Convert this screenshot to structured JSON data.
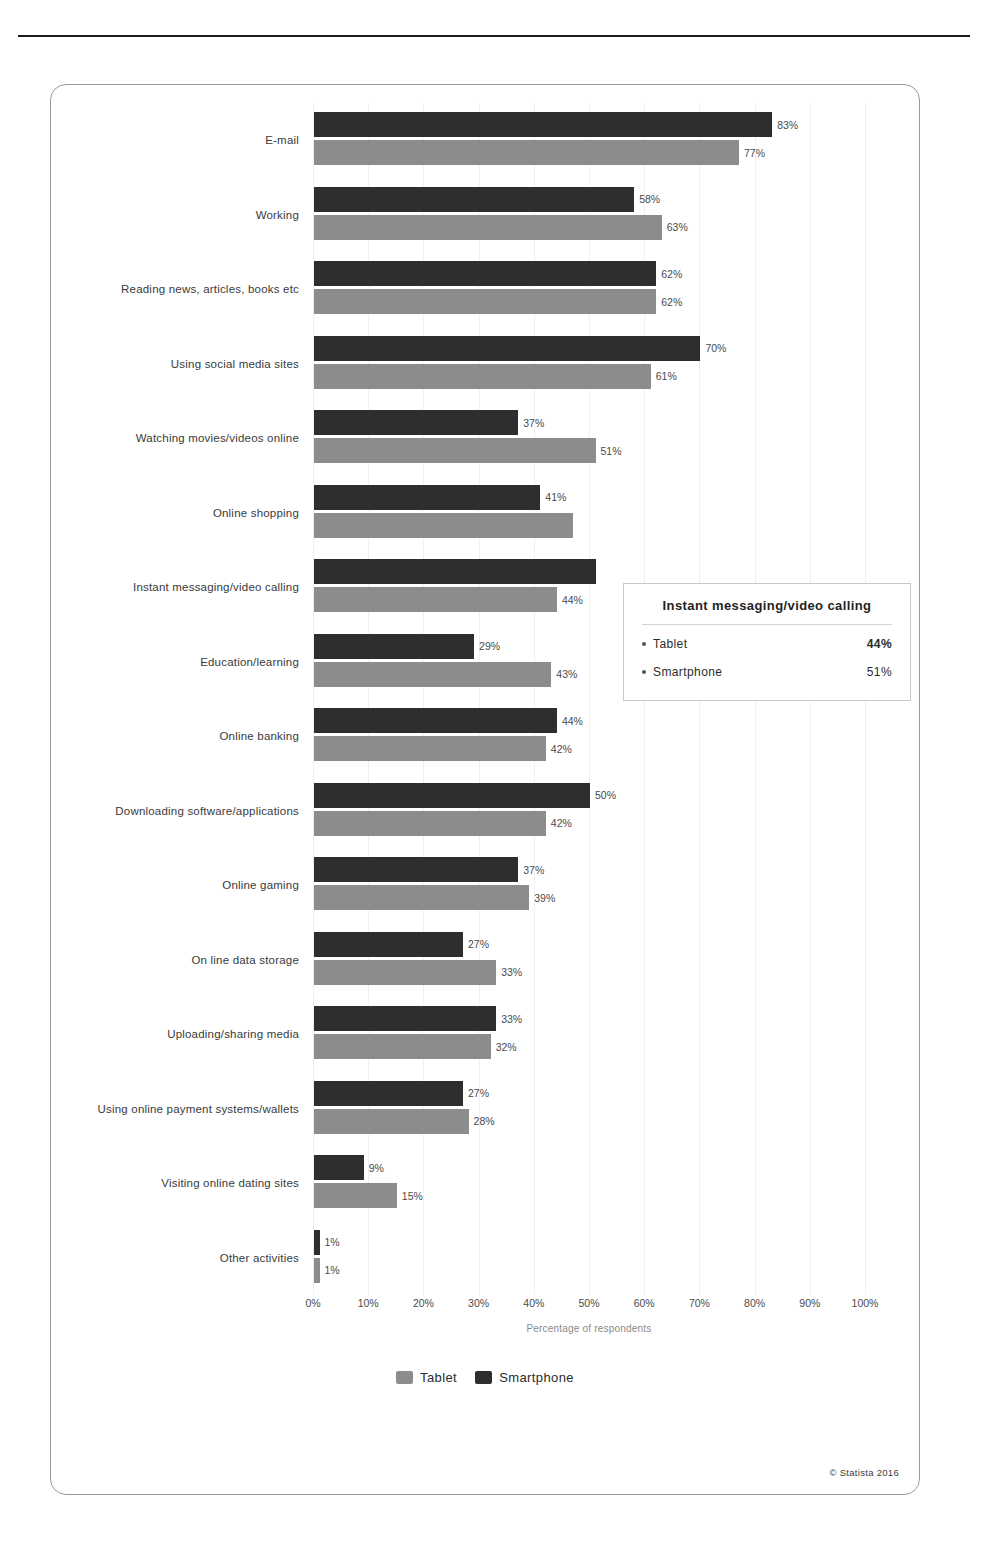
{
  "chart_data": {
    "type": "bar",
    "orientation": "horizontal",
    "title": "",
    "xlabel": "Percentage of respondents",
    "ylabel": "",
    "xlim": [
      0,
      100
    ],
    "grid": true,
    "legend_position": "bottom",
    "xticks": [
      "0%",
      "10%",
      "20%",
      "30%",
      "40%",
      "50%",
      "60%",
      "70%",
      "80%",
      "90%",
      "100%"
    ],
    "xtick_values": [
      0,
      10,
      20,
      30,
      40,
      50,
      60,
      70,
      80,
      90,
      100
    ],
    "categories": [
      "E-mail",
      "Working",
      "Reading news, articles, books etc",
      "Using social media sites",
      "Watching movies/videos online",
      "Online shopping",
      "Instant messaging/video calling",
      "Education/learning",
      "Online banking",
      "Downloading software/applications",
      "Online gaming",
      "On line data storage",
      "Uploading/sharing media",
      "Using online payment systems/wallets",
      "Visiting online dating sites",
      "Other activities"
    ],
    "series": [
      {
        "name": "Smartphone",
        "color": "#2e2e2e",
        "values": [
          83,
          58,
          62,
          70,
          37,
          41,
          51,
          29,
          44,
          50,
          37,
          27,
          33,
          27,
          9,
          1
        ],
        "labels": [
          "83%",
          "58%",
          "62%",
          "70%",
          "37%",
          "41%",
          "",
          "29%",
          "44%",
          "50%",
          "37%",
          "27%",
          "33%",
          "27%",
          "9%",
          "1%"
        ]
      },
      {
        "name": "Tablet",
        "color": "#8c8c8c",
        "values": [
          77,
          63,
          62,
          61,
          51,
          47,
          44,
          43,
          42,
          42,
          39,
          33,
          32,
          28,
          15,
          1
        ],
        "labels": [
          "77%",
          "63%",
          "62%",
          "61%",
          "51%",
          "",
          "44%",
          "43%",
          "42%",
          "42%",
          "39%",
          "33%",
          "32%",
          "28%",
          "15%",
          "1%"
        ]
      }
    ]
  },
  "legend": {
    "items": [
      {
        "label": "Tablet",
        "swatch": "tablet"
      },
      {
        "label": "Smartphone",
        "swatch": "smartphone"
      }
    ]
  },
  "tooltip": {
    "title": "Instant messaging/video calling",
    "rows": [
      {
        "key": "Tablet",
        "value": "44%",
        "bold": true
      },
      {
        "key": "Smartphone",
        "value": "51%",
        "bold": false
      }
    ]
  },
  "footer": {
    "copyright": "© Statista 2016"
  }
}
